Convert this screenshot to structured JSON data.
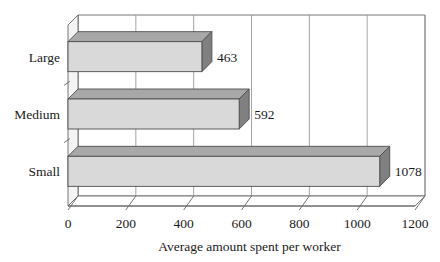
{
  "chart_data": {
    "type": "bar",
    "orientation": "horizontal",
    "style": "3d",
    "title": "",
    "xlabel": "Average amount spent per worker",
    "ylabel": "",
    "categories": [
      "Large",
      "Medium",
      "Small"
    ],
    "values": [
      463,
      592,
      1078
    ],
    "data_labels": [
      "463",
      "592",
      "1078"
    ],
    "xlim": [
      0,
      1200
    ],
    "xticks": [
      0,
      200,
      400,
      600,
      800,
      1000,
      1200
    ],
    "xtick_labels": [
      "0",
      "200",
      "400",
      "600",
      "800",
      "1000",
      "1200"
    ],
    "grid": "vertical",
    "legend": "none",
    "series": [
      {
        "name": "Average amount spent per worker",
        "values": [
          463,
          592,
          1078
        ]
      }
    ],
    "colors": {
      "bar_face": "#d9d9d9",
      "bar_side": "#808080",
      "bar_top": "#a8a8a8",
      "outline": "#4d4d4d",
      "grid": "#999999",
      "axis": "#666666",
      "text": "#1a1a1a",
      "background": "#ffffff"
    }
  }
}
